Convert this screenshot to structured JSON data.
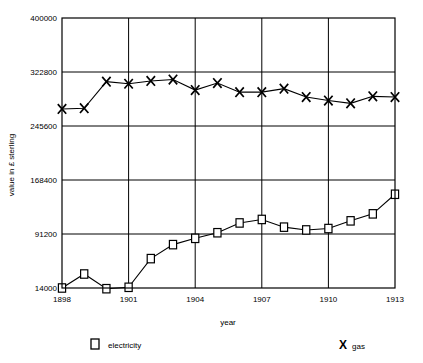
{
  "chart_data": {
    "type": "line",
    "title": "",
    "xlabel": "year",
    "ylabel": "value in £ sterling",
    "x": [
      1898,
      1899,
      1900,
      1901,
      1902,
      1903,
      1904,
      1905,
      1906,
      1907,
      1908,
      1909,
      1910,
      1911,
      1912,
      1913
    ],
    "xlim": [
      1898,
      1913
    ],
    "ylim": [
      14000,
      400000
    ],
    "xticks": [
      "1898",
      "1901",
      "1904",
      "1907",
      "1910",
      "1913"
    ],
    "xtick_values": [
      1898,
      1901,
      1904,
      1907,
      1910,
      1913
    ],
    "yticks": [
      "14000",
      "91200",
      "168400",
      "245600",
      "322800",
      "400000"
    ],
    "ytick_values": [
      14000,
      91200,
      168400,
      245600,
      322800,
      400000
    ],
    "grid": true,
    "legend_position": "bottom",
    "series": [
      {
        "name": "electricity",
        "marker": "square",
        "color": "#000000",
        "values": [
          14000,
          34000,
          13000,
          15000,
          56000,
          76000,
          85000,
          93000,
          107000,
          112000,
          101000,
          97000,
          99000,
          110000,
          120000,
          148000
        ]
      },
      {
        "name": "gas",
        "marker": "x",
        "color": "#000000",
        "values": [
          270000,
          271000,
          309000,
          306000,
          310000,
          312000,
          297000,
          307000,
          294000,
          294000,
          299000,
          287000,
          282000,
          278000,
          288000,
          287000
        ]
      }
    ]
  },
  "axes": {
    "y_title": "value in £ sterling",
    "x_title": "year"
  },
  "legend": {
    "items": [
      {
        "label": "electricity",
        "marker": "square"
      },
      {
        "label": "gas",
        "marker": "X"
      }
    ]
  },
  "colors": {
    "line": "#000000",
    "grid": "#000000",
    "axis": "#000000",
    "background": "#ffffff"
  }
}
